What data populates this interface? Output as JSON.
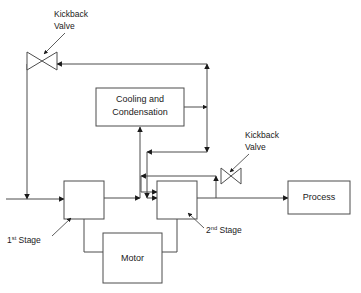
{
  "diagram": {
    "type": "process-flow-diagram",
    "colors": {
      "background": "#ffffff",
      "line": "#4d4d4d",
      "arrow": "#1a1a1a",
      "text": "#1a1a1a"
    },
    "boxes": [
      {
        "id": "cooling",
        "label_line1": "Cooling and",
        "label_line2": "Condensation",
        "x": 96,
        "y": 88,
        "w": 88,
        "h": 38
      },
      {
        "id": "first_stage",
        "label": "",
        "x": 64,
        "y": 181,
        "w": 40,
        "h": 38
      },
      {
        "id": "second_stage",
        "label": "",
        "x": 157,
        "y": 181,
        "w": 40,
        "h": 38
      },
      {
        "id": "motor",
        "label": "Motor",
        "x": 103,
        "y": 233,
        "w": 59,
        "h": 50
      },
      {
        "id": "process",
        "label": "Process",
        "x": 288,
        "y": 181,
        "w": 62,
        "h": 33
      }
    ],
    "valves": [
      {
        "id": "kickback_valve_left",
        "label_line1": "Kickback",
        "label_line2": "Valve",
        "cx": 42,
        "cy": 61,
        "label_x": 54,
        "label_y": 17
      },
      {
        "id": "kickback_valve_right",
        "label_line1": "Kickback",
        "label_line2": "Valve",
        "cx": 231,
        "cy": 176,
        "label_x": 245,
        "label_y": 138
      }
    ],
    "stage_labels": [
      {
        "id": "first_stage_label",
        "prefix": "1",
        "superscript": "st",
        "suffix": " Stage",
        "x": 7,
        "y": 243
      },
      {
        "id": "second_stage_label",
        "prefix": "2",
        "superscript": "nd",
        "suffix": " Stage",
        "x": 206,
        "y": 233
      }
    ]
  }
}
